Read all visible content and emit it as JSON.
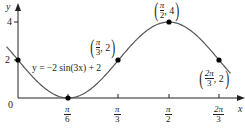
{
  "chart_data": {
    "type": "line",
    "title": "",
    "equation": "y = −2 sin(3x) + 2",
    "xlabel": "x",
    "ylabel": "y",
    "origin_label": "0",
    "x_ticks": [
      "π/6",
      "π/3",
      "π/2",
      "2π/3"
    ],
    "x_tick_values": [
      0.5236,
      1.0472,
      1.5708,
      2.0944
    ],
    "y_ticks": [
      "2",
      "4"
    ],
    "y_tick_values": [
      2,
      4
    ],
    "xlim": [
      0,
      2.2
    ],
    "ylim": [
      0,
      4.5
    ],
    "series": [
      {
        "name": "y = −2 sin(3x) + 2",
        "x_range": [
          0,
          2.0944
        ]
      }
    ],
    "points": [
      {
        "x": 0,
        "y": 2,
        "label": ""
      },
      {
        "x": "π/6",
        "y": 0,
        "label": ""
      },
      {
        "x": "π/3",
        "y": 2,
        "label": "(π/3, 2)"
      },
      {
        "x": "π/2",
        "y": 4,
        "label": "(π/2, 4)"
      },
      {
        "x": "2π/3",
        "y": 2,
        "label": "(2π/3, 2)"
      }
    ],
    "grid": false
  },
  "labels": {
    "y_axis": "y",
    "x_axis": "x",
    "origin": "0",
    "y4": "4",
    "y2": "2",
    "equation": "y = −2 sin(3x) + 2",
    "ticks": [
      {
        "num": "π",
        "den": "6"
      },
      {
        "num": "π",
        "den": "3"
      },
      {
        "num": "π",
        "den": "2"
      },
      {
        "num": "2π",
        "den": "3"
      }
    ],
    "p1": {
      "num": "π",
      "den": "3",
      "y": ", 2"
    },
    "p2": {
      "num": "π",
      "den": "2",
      "y": ", 4"
    },
    "p3": {
      "num": "2π",
      "den": "3",
      "y": ", 2"
    }
  }
}
